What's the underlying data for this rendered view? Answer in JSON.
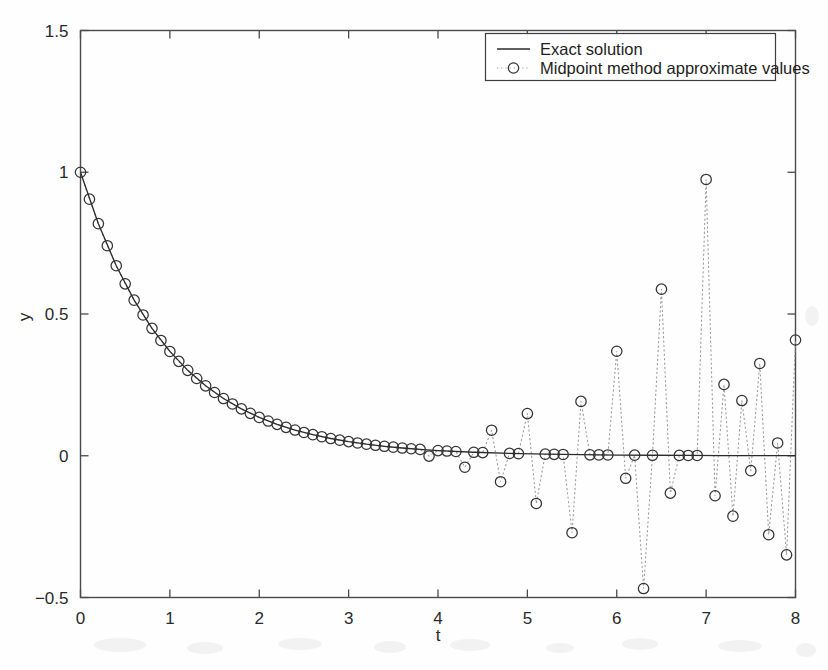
{
  "figure": {
    "background_color": "#fefefe",
    "axis_color": "#4a4a4a",
    "exact_color": "#2b2b2b",
    "marker_color": "#333333",
    "connector_color": "#9a9a9a"
  },
  "axes": {
    "xlabel": "t",
    "ylabel": "y",
    "x_ticks": [
      "0",
      "1",
      "2",
      "3",
      "4",
      "5",
      "6",
      "7",
      "8"
    ],
    "x_tick_values": [
      0,
      1,
      2,
      3,
      4,
      5,
      6,
      7,
      8
    ],
    "y_ticks": [
      "-0.5",
      "0",
      "0.5",
      "1",
      "1.5"
    ],
    "y_tick_values": [
      -0.5,
      0,
      0.5,
      1,
      1.5
    ],
    "xlim": [
      0,
      8
    ],
    "ylim": [
      -0.5,
      1.5
    ],
    "grid": false,
    "tick_direction": "in"
  },
  "legend": {
    "position": "top-right",
    "entries": [
      {
        "label": "Exact solution",
        "style": "line",
        "marker": "none"
      },
      {
        "label": "Midpoint method approximate values",
        "style": "dotted",
        "marker": "circle"
      }
    ]
  },
  "chart_data": {
    "type": "line",
    "title": "",
    "subtitle": "",
    "xlabel": "t",
    "ylabel": "y",
    "xlim": [
      0,
      8
    ],
    "ylim": [
      -0.5,
      1.5
    ],
    "grid": false,
    "legend_position": "top-right",
    "annotations": [],
    "series": [
      {
        "name": "Exact solution",
        "style": "solid-line",
        "marker": "none",
        "color": "#2b2b2b",
        "description": "y = exp(-t), smooth exponential decay from 1 at t=0 toward 0",
        "x": [
          0,
          0.2,
          0.4,
          0.6,
          0.8,
          1,
          1.2,
          1.4,
          1.6,
          1.8,
          2,
          2.2,
          2.4,
          2.6,
          2.8,
          3,
          3.2,
          3.4,
          3.6,
          3.8,
          4,
          4.4,
          4.8,
          5.2,
          5.6,
          6,
          6.4,
          6.8,
          7.2,
          7.6,
          8
        ],
        "y": [
          1,
          0.8187,
          0.6703,
          0.5488,
          0.4493,
          0.3679,
          0.3012,
          0.2466,
          0.2019,
          0.1653,
          0.1353,
          0.1108,
          0.0907,
          0.0743,
          0.0608,
          0.0498,
          0.0408,
          0.0334,
          0.0273,
          0.0224,
          0.0183,
          0.0123,
          0.0082,
          0.0055,
          0.0037,
          0.0025,
          0.0017,
          0.0011,
          0.0007,
          0.0005,
          0.0003
        ]
      },
      {
        "name": "Midpoint method approximate values",
        "style": "dotted-line",
        "marker": "circle",
        "color": "#333333",
        "step_size": 0.1,
        "description": "Leapfrog/midpoint method on y'=-y: follows exp(-t) early, then a growing parasitic oscillation with alternating sign dominates after t about 3.5",
        "x": [
          0,
          0.1,
          0.2,
          0.3,
          0.4,
          0.5,
          0.6,
          0.7,
          0.8,
          0.9,
          1,
          1.1,
          1.2,
          1.3,
          1.4,
          1.5,
          1.6,
          1.7,
          1.8,
          1.9,
          2,
          2.1,
          2.2,
          2.3,
          2.4,
          2.5,
          2.6,
          2.7,
          2.8,
          2.9,
          3,
          3.1,
          3.2,
          3.3,
          3.4,
          3.5,
          3.6,
          3.7,
          3.8,
          3.9,
          4,
          4.1,
          4.2,
          4.3,
          4.4,
          4.5,
          4.6,
          4.7,
          4.8,
          4.9,
          5,
          5.1,
          5.2,
          5.3,
          5.4,
          5.5,
          5.6,
          5.7,
          5.8,
          5.9,
          6,
          6.1,
          6.2,
          6.3,
          6.4,
          6.5,
          6.6,
          6.7,
          6.8,
          6.9,
          7,
          7.1,
          7.2,
          7.3,
          7.4,
          7.5,
          7.6,
          7.7,
          7.8,
          7.9,
          8
        ],
        "y": [
          1,
          0.905,
          0.8187,
          0.7408,
          0.6703,
          0.6065,
          0.5488,
          0.4966,
          0.4493,
          0.4066,
          0.3679,
          0.3329,
          0.3012,
          0.2725,
          0.2466,
          0.2231,
          0.2019,
          0.1827,
          0.1653,
          0.1496,
          0.1353,
          0.1225,
          0.1108,
          0.1003,
          0.0907,
          0.0821,
          0.0743,
          0.0672,
          0.0608,
          0.055,
          0.0498,
          0.0451,
          0.0408,
          0.0369,
          0.0334,
          0.0302,
          0.0273,
          0.0247,
          0.0224,
          -0.0011,
          0.0183,
          0.0166,
          0.015,
          -0.0404,
          0.0123,
          0.0111,
          0.0901,
          -0.0916,
          0.0082,
          0.0074,
          0.1487,
          -0.1683,
          0.0055,
          0.005,
          0.0045,
          -0.2715,
          0.1917,
          0.0033,
          0.003,
          0.0027,
          0.3686,
          -0.0794,
          0.0021,
          -0.4684,
          0.0017,
          0.5877,
          -0.1319,
          0.0011,
          0.001,
          0.0009,
          0.9745,
          -0.1411,
          0.2516,
          -0.2131,
          0.1948,
          -0.0527,
          0.3255,
          -0.2785,
          0.0451,
          -0.3496,
          0.4083
        ]
      }
    ]
  }
}
